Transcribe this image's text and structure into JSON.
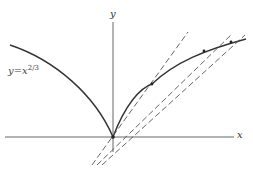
{
  "figure": {
    "x_axis_label": "x",
    "y_axis_label": "y",
    "function_label": {
      "lhs": "y=x",
      "exponent": "2/3"
    },
    "colors": {
      "curve": "#333333",
      "axes": "#555555",
      "dashed": "#555555"
    },
    "secant_lines": 3,
    "marked_points": 3
  }
}
